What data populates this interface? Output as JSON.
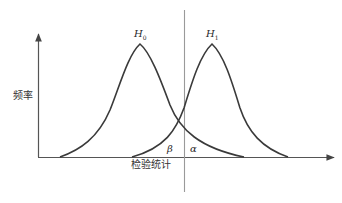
{
  "diagram": {
    "type": "hypothesis-test-distributions",
    "y_axis_label": "频率",
    "x_axis_label": "检验统计",
    "distributions": [
      {
        "name": "H0",
        "label_main": "H",
        "label_sub": "0",
        "peak_x": 140,
        "peak_y": 44
      },
      {
        "name": "H1",
        "label_main": "H",
        "label_sub": "1",
        "peak_x": 212,
        "peak_y": 44
      }
    ],
    "critical_line": {
      "x": 184,
      "y_top": 10,
      "y_bottom": 192
    },
    "regions": {
      "beta_label": "β",
      "alpha_label": "α"
    },
    "colors": {
      "curve": "#3a3a3a",
      "axis": "#555555",
      "critical_line": "#9a9a9a",
      "text": "#2a2a2a"
    }
  }
}
